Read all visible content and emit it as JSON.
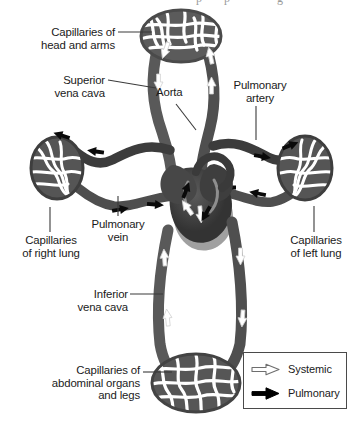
{
  "figure": {
    "cropped_top_fragment": "pp g"
  },
  "labels": [
    {
      "id": "capillaries-head-arms",
      "text": "Capillaries of\nhead and arms",
      "align": "right",
      "x": 3,
      "y": 26,
      "width": 112
    },
    {
      "id": "superior-vena-cava",
      "text": "Superior\nvena cava",
      "align": "right",
      "x": 3,
      "y": 74,
      "width": 102
    },
    {
      "id": "aorta",
      "text": "Aorta",
      "align": "left",
      "x": 156,
      "y": 86,
      "width": 44
    },
    {
      "id": "pulmonary-artery",
      "text": "Pulmonary\nartery",
      "align": "center",
      "x": 224,
      "y": 79,
      "width": 72
    },
    {
      "id": "capillaries-right-lung",
      "text": "Capillaries\nof right lung",
      "align": "center",
      "x": 6,
      "y": 234,
      "width": 90
    },
    {
      "id": "pulmonary-vein",
      "text": "Pulmonary\nvein",
      "align": "center",
      "x": 82,
      "y": 218,
      "width": 72
    },
    {
      "id": "capillaries-left-lung",
      "text": "Capillaries\nof left lung",
      "align": "center",
      "x": 277,
      "y": 234,
      "width": 78
    },
    {
      "id": "inferior-vena-cava",
      "text": "Inferior\nvena cava",
      "align": "right",
      "x": 48,
      "y": 288,
      "width": 80
    },
    {
      "id": "capillaries-abdominal",
      "text": "Capillaries of\nabdominal organs\nand legs",
      "align": "right",
      "x": 10,
      "y": 364,
      "width": 130
    }
  ],
  "legend": {
    "items": [
      {
        "id": "systemic",
        "label": "Systemic",
        "arrow_style": "outline",
        "color": "#ffffff",
        "stroke": "#6e6e6e"
      },
      {
        "id": "pulmonary",
        "label": "Pulmonary",
        "arrow_style": "solid",
        "color": "#000000",
        "stroke": "#000000"
      }
    ]
  },
  "colors": {
    "background": "#ffffff",
    "vessel_gray": "#5a5a5a",
    "vessel_dark": "#3b3b3b",
    "heart_dark": "#3a3a3a",
    "heart_mid": "#555555",
    "heart_light": "#9d9d9d",
    "arrow_outline_fill": "#ffffff",
    "arrow_outline_stroke": "#d8d8d8",
    "arrow_solid": "#0a0a0a",
    "leader_line": "#3a3a3a",
    "text": "#1a1a1a",
    "legend_border": "#4a4a4a"
  },
  "structures": {
    "capillary_beds": [
      {
        "id": "head-and-arms",
        "cx": 181,
        "cy": 36,
        "rx": 40,
        "ry": 26
      },
      {
        "id": "right-lung",
        "cx": 57,
        "cy": 168,
        "rx": 26,
        "ry": 31
      },
      {
        "id": "left-lung",
        "cx": 305,
        "cy": 168,
        "rx": 27,
        "ry": 32
      },
      {
        "id": "abdominal-organs-and-legs",
        "cx": 196,
        "cy": 383,
        "rx": 44,
        "ry": 29
      }
    ],
    "heart": {
      "cx": 200,
      "cy": 195,
      "label": "heart"
    }
  }
}
